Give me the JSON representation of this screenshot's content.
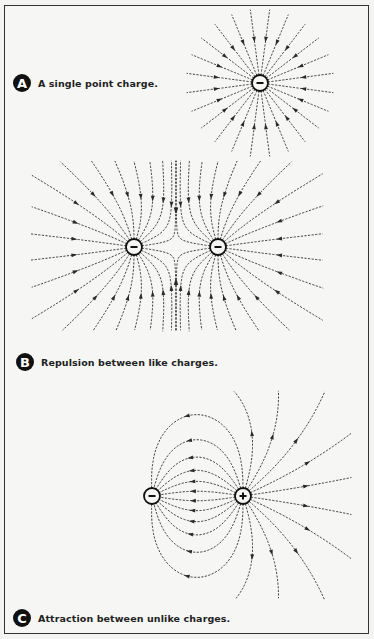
{
  "figures": [
    {
      "id": "A",
      "caption": "A single point charge.",
      "badge": "A",
      "charges": [
        {
          "x": 260,
          "y": 83,
          "sign": "-",
          "q": -1
        }
      ],
      "lines_per_charge": 24,
      "bounds": {
        "x0": 182,
        "y0": 8,
        "x1": 338,
        "y1": 155
      },
      "radial": true,
      "radius": 75
    },
    {
      "id": "B",
      "caption": "Repulsion between like charges.",
      "badge": "B",
      "charges": [
        {
          "x": 134,
          "y": 247,
          "sign": "-",
          "q": -1
        },
        {
          "x": 218,
          "y": 247,
          "sign": "-",
          "q": -1
        }
      ],
      "lines_per_charge": 22,
      "bounds": {
        "x0": 32,
        "y0": 162,
        "x1": 322,
        "y1": 330
      }
    },
    {
      "id": "C",
      "caption": "Attraction between unlike charges.",
      "badge": "C",
      "charges": [
        {
          "x": 152,
          "y": 496,
          "sign": "-",
          "q": -1
        },
        {
          "x": 243,
          "y": 496,
          "sign": "+",
          "q": 1
        }
      ],
      "lines_per_charge": 22,
      "bounds": {
        "x0": 47,
        "y0": 392,
        "x1": 350,
        "y1": 598
      }
    }
  ],
  "colors": {
    "ink": "#2a2a2a",
    "paper": "#f6f6f4",
    "badge": "#111111"
  }
}
